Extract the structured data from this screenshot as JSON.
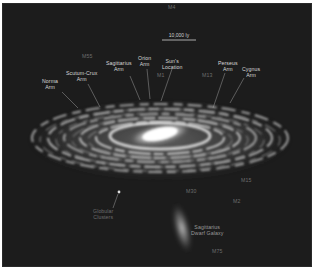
{
  "diagram": {
    "background_color": "#1c1c1c",
    "label_color": "#d8d8d8",
    "scale_bar": {
      "label": "10,000 ly"
    },
    "arms": [
      {
        "label": "Norma\nArm"
      },
      {
        "label": "Scutum-Crux\nArm"
      },
      {
        "label": "Sagittarius\nArm"
      },
      {
        "label": "Orion\nArm"
      },
      {
        "label": "Sun's\nLocation"
      },
      {
        "label": "Perseus\nArm"
      },
      {
        "label": "Cygnus\nArm"
      }
    ],
    "clusters": [
      {
        "label": "M4"
      },
      {
        "label": "M55"
      },
      {
        "label": "M1"
      },
      {
        "label": "M13"
      },
      {
        "label": "M15"
      },
      {
        "label": "M2"
      },
      {
        "label": "M30"
      },
      {
        "label": "M75"
      }
    ],
    "features": [
      {
        "label": "Globular\nClusters"
      },
      {
        "label": "Sagittarius\nDwarf Galaxy"
      }
    ]
  }
}
